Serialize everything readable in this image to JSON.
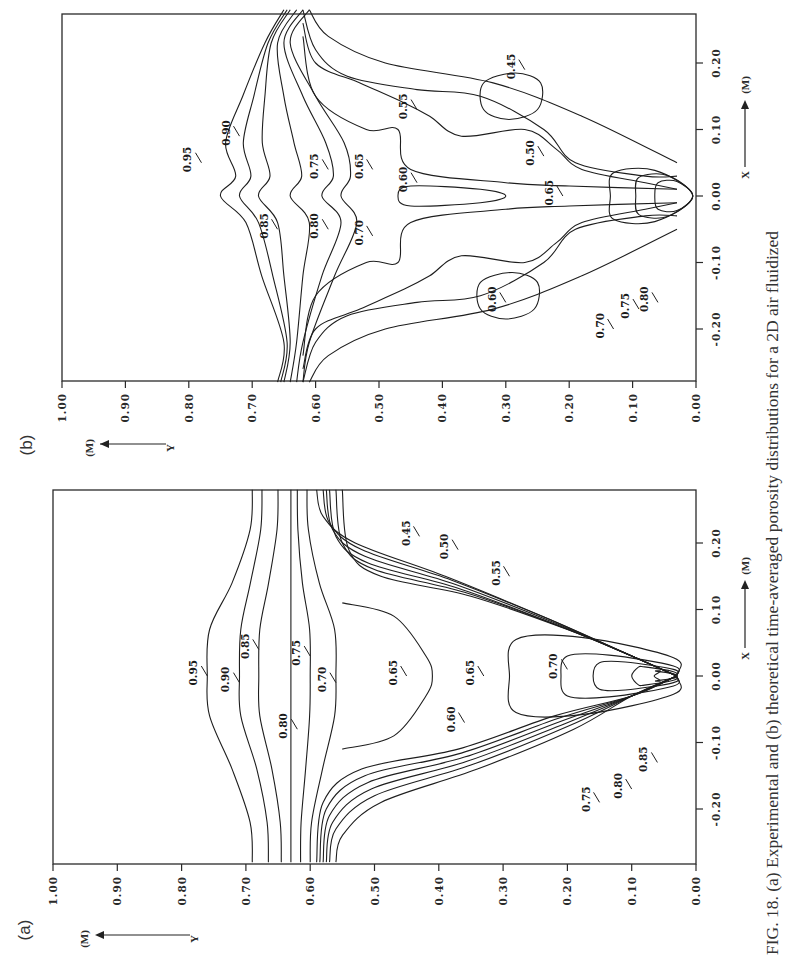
{
  "figure": {
    "caption": "FIG. 18. (a) Experimental and (b) theoretical time-averaged porosity distributions for a 2D air fluidized",
    "caption_prefix": "FIG. 18.",
    "orientation": "rotated 90° counter-clockwise (page landscape)"
  },
  "chart_data": [
    {
      "panel": "(a)",
      "type": "contour",
      "title": "Experimental time-averaged porosity distribution",
      "xlabel": "X (M)",
      "ylabel": "Y (M)",
      "x_ticks": [
        "-0.20",
        "-0.10",
        "0.00",
        "0.10",
        "0.20"
      ],
      "y_ticks": [
        "0.00",
        "0.10",
        "0.20",
        "0.30",
        "0.40",
        "0.50",
        "0.60",
        "0.70",
        "0.80",
        "0.90",
        "1.00"
      ],
      "xlim": [
        -0.28,
        0.28
      ],
      "ylim": [
        0.0,
        1.0
      ],
      "contour_levels": [
        "0.45",
        "0.50",
        "0.55",
        "0.60",
        "0.65",
        "0.70",
        "0.75",
        "0.80",
        "0.85",
        "0.90",
        "0.95"
      ],
      "contour_labels": [
        {
          "text": "0.95",
          "x": 0.0,
          "y": 0.76
        },
        {
          "text": "0.90",
          "x": -0.01,
          "y": 0.71
        },
        {
          "text": "0.85",
          "x": 0.04,
          "y": 0.68
        },
        {
          "text": "0.80",
          "x": -0.08,
          "y": 0.62
        },
        {
          "text": "0.75",
          "x": 0.03,
          "y": 0.6
        },
        {
          "text": "0.70",
          "x": -0.01,
          "y": 0.56
        },
        {
          "text": "0.65",
          "x": 0.0,
          "y": 0.45
        },
        {
          "text": "0.60",
          "x": -0.07,
          "y": 0.36
        },
        {
          "text": "0.65",
          "x": 0.0,
          "y": 0.33
        },
        {
          "text": "0.70",
          "x": 0.01,
          "y": 0.2
        },
        {
          "text": "0.75",
          "x": -0.19,
          "y": 0.15
        },
        {
          "text": "0.80",
          "x": -0.17,
          "y": 0.1
        },
        {
          "text": "0.85",
          "x": -0.13,
          "y": 0.06
        },
        {
          "text": "0.45",
          "x": 0.21,
          "y": 0.43
        },
        {
          "text": "0.50",
          "x": 0.19,
          "y": 0.37
        },
        {
          "text": "0.55",
          "x": 0.15,
          "y": 0.29
        }
      ]
    },
    {
      "panel": "(b)",
      "type": "contour",
      "title": "Theoretical time-averaged porosity distribution",
      "xlabel": "X (M)",
      "ylabel": "Y (M)",
      "x_ticks": [
        "-0.20",
        "-0.10",
        "0.00",
        "0.10",
        "0.20"
      ],
      "y_ticks": [
        "0.00",
        "0.10",
        "0.20",
        "0.30",
        "0.40",
        "0.50",
        "0.60",
        "0.70",
        "0.80",
        "0.90",
        "1.00"
      ],
      "xlim": [
        -0.28,
        0.28
      ],
      "ylim": [
        0.0,
        1.0
      ],
      "contour_levels": [
        "0.45",
        "0.50",
        "0.55",
        "0.60",
        "0.65",
        "0.70",
        "0.75",
        "0.80",
        "0.85",
        "0.90",
        "0.95"
      ],
      "contour_labels": [
        {
          "text": "0.95",
          "x": 0.05,
          "y": 0.78
        },
        {
          "text": "0.90",
          "x": 0.09,
          "y": 0.72
        },
        {
          "text": "0.85",
          "x": -0.05,
          "y": 0.66
        },
        {
          "text": "0.80",
          "x": -0.05,
          "y": 0.58
        },
        {
          "text": "0.75",
          "x": 0.04,
          "y": 0.58
        },
        {
          "text": "0.70",
          "x": -0.06,
          "y": 0.51
        },
        {
          "text": "0.65",
          "x": 0.04,
          "y": 0.51
        },
        {
          "text": "0.60",
          "x": 0.02,
          "y": 0.44
        },
        {
          "text": "0.55",
          "x": 0.13,
          "y": 0.44
        },
        {
          "text": "0.45",
          "x": 0.19,
          "y": 0.27
        },
        {
          "text": "0.50",
          "x": 0.06,
          "y": 0.24
        },
        {
          "text": "0.65",
          "x": 0.0,
          "y": 0.21
        },
        {
          "text": "0.60",
          "x": -0.16,
          "y": 0.3
        },
        {
          "text": "0.70",
          "x": -0.2,
          "y": 0.13
        },
        {
          "text": "0.75",
          "x": -0.17,
          "y": 0.09
        },
        {
          "text": "0.80",
          "x": -0.16,
          "y": 0.06
        }
      ]
    }
  ],
  "labels": {
    "panel_a": "(a)",
    "panel_b": "(b)",
    "x_axis_name": "X",
    "y_axis_name": "Y",
    "unit": "(M)"
  }
}
